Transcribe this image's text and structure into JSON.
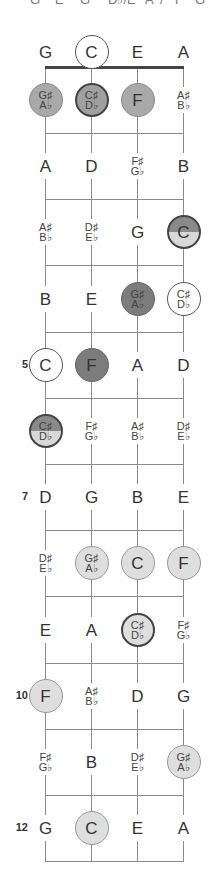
{
  "header_fragments": [
    "G",
    "E",
    "G",
    "D♭/E",
    "A",
    "/",
    "F",
    "G"
  ],
  "tuning": [
    "G",
    "C",
    "E",
    "A"
  ],
  "strings_x": [
    45,
    91,
    137,
    183
  ],
  "colors": {
    "string_line": "#8a8a8a",
    "nut": "#444444",
    "medium_fill": "#a9a9a9",
    "dark_fill": "#7c7c7c",
    "light_fill": "#dedede"
  },
  "fret_markers": [
    {
      "fret": 5,
      "label": "5"
    },
    {
      "fret": 7,
      "label": "7"
    },
    {
      "fret": 10,
      "label": "10"
    },
    {
      "fret": 12,
      "label": "12"
    }
  ],
  "rows": [
    {
      "fret": 0,
      "notes": [
        {
          "text": "G",
          "style": "plain"
        },
        {
          "text": "C",
          "style": "open-ring"
        },
        {
          "text": "E",
          "style": "plain"
        },
        {
          "text": "A",
          "style": "plain"
        }
      ]
    },
    {
      "fret": 1,
      "notes": [
        {
          "top": "G♯",
          "bottom": "A♭",
          "style": "medium"
        },
        {
          "top": "C♯",
          "bottom": "D♭",
          "style": "medium ring-bold"
        },
        {
          "text": "F",
          "style": "medium"
        },
        {
          "top": "A♯",
          "bottom": "B♭",
          "style": "plain"
        }
      ]
    },
    {
      "fret": 2,
      "notes": [
        {
          "text": "A",
          "style": "plain"
        },
        {
          "text": "D",
          "style": "plain"
        },
        {
          "top": "F♯",
          "bottom": "G♭",
          "style": "plain"
        },
        {
          "text": "B",
          "style": "plain"
        }
      ]
    },
    {
      "fret": 3,
      "notes": [
        {
          "top": "A♯",
          "bottom": "B♭",
          "style": "plain"
        },
        {
          "top": "D♯",
          "bottom": "E♭",
          "style": "plain"
        },
        {
          "text": "G",
          "style": "plain"
        },
        {
          "text": "C",
          "style": "split"
        }
      ]
    },
    {
      "fret": 4,
      "notes": [
        {
          "text": "B",
          "style": "plain"
        },
        {
          "text": "E",
          "style": "plain"
        },
        {
          "top": "G♯",
          "bottom": "A♭",
          "style": "dark"
        },
        {
          "top": "C♯",
          "bottom": "D♭",
          "style": "open-ring"
        }
      ]
    },
    {
      "fret": 5,
      "notes": [
        {
          "text": "C",
          "style": "open-ring"
        },
        {
          "text": "F",
          "style": "dark"
        },
        {
          "text": "A",
          "style": "plain"
        },
        {
          "text": "D",
          "style": "plain"
        }
      ]
    },
    {
      "fret": 6,
      "notes": [
        {
          "top": "C♯",
          "bottom": "D♭",
          "style": "split"
        },
        {
          "top": "F♯",
          "bottom": "G♭",
          "style": "plain"
        },
        {
          "top": "A♯",
          "bottom": "B♭",
          "style": "plain"
        },
        {
          "top": "D♯",
          "bottom": "E♭",
          "style": "plain"
        }
      ]
    },
    {
      "fret": 7,
      "notes": [
        {
          "text": "D",
          "style": "plain"
        },
        {
          "text": "G",
          "style": "plain"
        },
        {
          "text": "B",
          "style": "plain"
        },
        {
          "text": "E",
          "style": "plain"
        }
      ]
    },
    {
      "fret": 8,
      "notes": [
        {
          "top": "D♯",
          "bottom": "E♭",
          "style": "plain"
        },
        {
          "top": "G♯",
          "bottom": "A♭",
          "style": "light"
        },
        {
          "text": "C",
          "style": "light"
        },
        {
          "text": "F",
          "style": "light"
        }
      ]
    },
    {
      "fret": 9,
      "notes": [
        {
          "text": "E",
          "style": "plain"
        },
        {
          "text": "A",
          "style": "plain"
        },
        {
          "top": "C♯",
          "bottom": "D♭",
          "style": "light ring-bold"
        },
        {
          "top": "F♯",
          "bottom": "G♭",
          "style": "plain"
        }
      ]
    },
    {
      "fret": 10,
      "notes": [
        {
          "text": "F",
          "style": "light"
        },
        {
          "top": "A♯",
          "bottom": "B♭",
          "style": "plain"
        },
        {
          "text": "D",
          "style": "plain"
        },
        {
          "text": "G",
          "style": "plain"
        }
      ]
    },
    {
      "fret": 11,
      "notes": [
        {
          "top": "F♯",
          "bottom": "G♭",
          "style": "plain"
        },
        {
          "text": "B",
          "style": "plain"
        },
        {
          "top": "D♯",
          "bottom": "E♭",
          "style": "plain"
        },
        {
          "top": "G♯",
          "bottom": "A♭",
          "style": "light"
        }
      ]
    },
    {
      "fret": 12,
      "notes": [
        {
          "text": "G",
          "style": "plain"
        },
        {
          "text": "C",
          "style": "light"
        },
        {
          "text": "E",
          "style": "plain"
        },
        {
          "text": "A",
          "style": "plain"
        }
      ]
    }
  ]
}
